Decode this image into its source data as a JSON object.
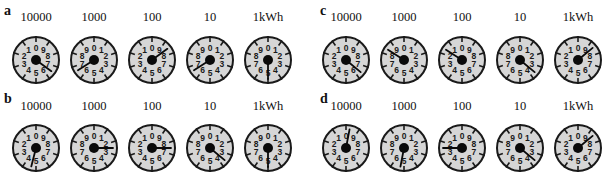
{
  "figure": {
    "dial_labels": [
      "10000",
      "1000",
      "100",
      "10",
      "1kWh"
    ],
    "digits": [
      "0",
      "1",
      "2",
      "3",
      "4",
      "5",
      "6",
      "7",
      "8",
      "9"
    ],
    "colors": {
      "face": "#d6d6d6",
      "ink": "#1a1a1a",
      "background": "#ffffff"
    },
    "panels": [
      {
        "letter": "a",
        "dials": [
          {
            "label": "10000",
            "direction": "counterclockwise",
            "pointer_value": 6.5
          },
          {
            "label": "1000",
            "direction": "clockwise",
            "pointer_value": 6.6
          },
          {
            "label": "100",
            "direction": "counterclockwise",
            "pointer_value": 8.5
          },
          {
            "label": "10",
            "direction": "clockwise",
            "pointer_value": 6.6
          },
          {
            "label": "1kWh",
            "direction": "clockwise",
            "pointer_value": 5.0
          }
        ]
      },
      {
        "letter": "b",
        "dials": [
          {
            "label": "10000",
            "direction": "counterclockwise",
            "pointer_value": 4.6
          },
          {
            "label": "1000",
            "direction": "clockwise",
            "pointer_value": 2.5
          },
          {
            "label": "100",
            "direction": "counterclockwise",
            "pointer_value": 7.5
          },
          {
            "label": "10",
            "direction": "clockwise",
            "pointer_value": 3.6
          },
          {
            "label": "1kWh",
            "direction": "clockwise",
            "pointer_value": 5.0
          }
        ]
      },
      {
        "letter": "c",
        "dials": [
          {
            "label": "10000",
            "direction": "counterclockwise",
            "pointer_value": 6.4
          },
          {
            "label": "1000",
            "direction": "clockwise",
            "pointer_value": 8.4
          },
          {
            "label": "100",
            "direction": "counterclockwise",
            "pointer_value": 1.6
          },
          {
            "label": "10",
            "direction": "clockwise",
            "pointer_value": 3.6
          },
          {
            "label": "1kWh",
            "direction": "counterclockwise",
            "pointer_value": 8.6
          }
        ]
      },
      {
        "letter": "d",
        "dials": [
          {
            "label": "10000",
            "direction": "counterclockwise",
            "pointer_value": 9.7
          },
          {
            "label": "1000",
            "direction": "clockwise",
            "pointer_value": 5.3
          },
          {
            "label": "100",
            "direction": "counterclockwise",
            "pointer_value": 2.5
          },
          {
            "label": "10",
            "direction": "clockwise",
            "pointer_value": 3.6
          },
          {
            "label": "1kWh",
            "direction": "counterclockwise",
            "pointer_value": 8.6
          }
        ]
      }
    ]
  }
}
